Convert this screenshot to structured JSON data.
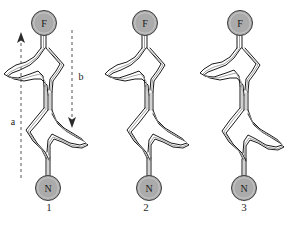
{
  "figure": {
    "caption": "",
    "background_color": "#ffffff",
    "node_fill_color": "#ababab",
    "node_stroke_color": "#3a3a3a",
    "ribbon_stroke_color": "#1a1a1a",
    "ribbon_inner_color": "#9a9a9a",
    "arrow_color": "#2b2b2b"
  },
  "panels": [
    {
      "number": "1",
      "top_node_label": "F",
      "bottom_node_label": "N",
      "arrows": [
        {
          "label": "a",
          "direction": "up"
        },
        {
          "label": "b",
          "direction": "down"
        }
      ]
    },
    {
      "number": "2",
      "top_node_label": "F",
      "bottom_node_label": "N",
      "arrows": []
    },
    {
      "number": "3",
      "top_node_label": "F",
      "bottom_node_label": "N",
      "arrows": []
    }
  ]
}
